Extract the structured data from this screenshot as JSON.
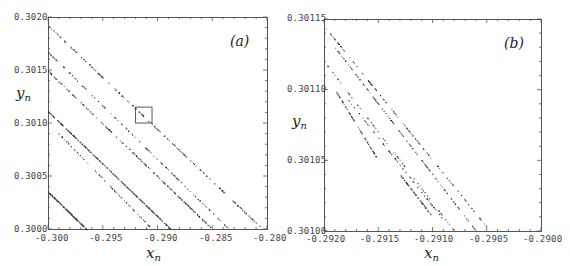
{
  "figure": {
    "panels": [
      {
        "id": "a",
        "label": "(a)",
        "xlabel_main": "x",
        "xlabel_sub": "n",
        "ylabel_main": "y",
        "ylabel_sub": "n",
        "xticks": [
          "-0.300",
          "-0.295",
          "-0.290",
          "-0.285",
          "-0.280"
        ],
        "yticks": [
          "0.3000",
          "0.3005",
          "0.3010",
          "0.3015",
          "0.3020"
        ]
      },
      {
        "id": "b",
        "label": "(b)",
        "xlabel_main": "x",
        "xlabel_sub": "n",
        "ylabel_main": "y",
        "ylabel_sub": "n",
        "xticks": [
          "-0.2920",
          "-0.2915",
          "-0.2910",
          "-0.2905",
          "-0.2900"
        ],
        "yticks": [
          "0.30100",
          "0.30105",
          "0.30110",
          "0.30115"
        ]
      }
    ]
  },
  "chart_data": [
    {
      "type": "scatter",
      "title": "(a)",
      "xlabel": "x_n",
      "ylabel": "y_n",
      "xlim": [
        -0.3,
        -0.28
      ],
      "ylim": [
        0.3,
        0.302
      ],
      "grid": false,
      "legend": null,
      "annotations": [
        {
          "type": "rectangle",
          "label": "zoom region shown in (b)",
          "x": [
            -0.292,
            -0.2905
          ],
          "y": [
            0.301,
            0.30115
          ]
        }
      ],
      "series": [
        {
          "name": "band-1",
          "x": [
            -0.3,
            -0.2805
          ],
          "y": [
            0.30192,
            0.30001
          ],
          "density": "dense"
        },
        {
          "name": "band-2",
          "x": [
            -0.3,
            -0.2835
          ],
          "y": [
            0.30167,
            0.3
          ],
          "density": "medium"
        },
        {
          "name": "band-3",
          "x": [
            -0.3,
            -0.285
          ],
          "y": [
            0.30149,
            0.3
          ],
          "density": "dense"
        },
        {
          "name": "band-4",
          "x": [
            -0.3,
            -0.2888
          ],
          "y": [
            0.30111,
            0.3
          ],
          "density": "solid"
        },
        {
          "name": "band-5",
          "x": [
            -0.2995,
            -0.2905
          ],
          "y": [
            0.30095,
            0.3
          ],
          "density": "sparse"
        },
        {
          "name": "band-6",
          "x": [
            -0.3,
            -0.2965
          ],
          "y": [
            0.30035,
            0.3
          ],
          "density": "medium"
        }
      ]
    },
    {
      "type": "scatter",
      "title": "(b)",
      "xlabel": "x_n",
      "ylabel": "y_n",
      "xlim": [
        -0.292,
        -0.29
      ],
      "ylim": [
        0.301,
        0.30115
      ],
      "grid": false,
      "legend": null,
      "series": [
        {
          "name": "band-1",
          "x": [
            -0.292,
            -0.29047
          ],
          "y": [
            0.301145,
            0.301
          ],
          "density": "medium"
        },
        {
          "name": "band-2",
          "x": [
            -0.2919,
            -0.2906
          ],
          "y": [
            0.30113,
            0.301
          ],
          "density": "medium"
        },
        {
          "name": "band-3",
          "x": [
            -0.292,
            -0.2908
          ],
          "y": [
            0.30112,
            0.301
          ],
          "density": "sparse"
        },
        {
          "name": "band-4",
          "x": [
            -0.2918,
            -0.29092
          ],
          "y": [
            0.301095,
            0.30101
          ],
          "density": "sparse"
        },
        {
          "name": "band-5",
          "x": [
            -0.2919,
            -0.2915
          ],
          "y": [
            0.3011,
            0.30105
          ],
          "density": "sparse"
        },
        {
          "name": "band-6",
          "x": [
            -0.2913,
            -0.291
          ],
          "y": [
            0.30104,
            0.30101
          ],
          "density": "sparse"
        }
      ]
    }
  ]
}
